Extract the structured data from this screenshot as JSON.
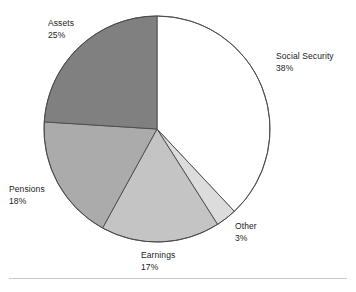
{
  "chart_data": {
    "type": "pie",
    "title": "",
    "subtitle": "",
    "xlabel": "",
    "ylabel": "",
    "legend_position": "none",
    "grid": false,
    "units": "percent",
    "start_angle_deg": 0,
    "direction": "clockwise",
    "categories": [
      "Social Security",
      "Other",
      "Earnings",
      "Pensions",
      "Assets"
    ],
    "values": [
      38,
      3,
      17,
      18,
      25
    ],
    "slices": [
      {
        "label": "Social Security",
        "value": 38,
        "value_text": "38%",
        "color": "#ffffff",
        "start_deg": 0,
        "end_deg": 136.8
      },
      {
        "label": "Other",
        "value": 3,
        "value_text": "3%",
        "color": "#dcdcdc",
        "start_deg": 136.8,
        "end_deg": 147.6
      },
      {
        "label": "Earnings",
        "value": 17,
        "value_text": "17%",
        "color": "#c4c4c4",
        "start_deg": 147.6,
        "end_deg": 208.8
      },
      {
        "label": "Pensions",
        "value": 18,
        "value_text": "18%",
        "color": "#ababab",
        "start_deg": 208.8,
        "end_deg": 273.6
      },
      {
        "label": "Assets",
        "value": 25,
        "value_text": "25%",
        "color": "#808080",
        "start_deg": 273.6,
        "end_deg": 360
      }
    ],
    "geometry": {
      "center_x": 157,
      "center_y": 129,
      "radius": 113
    },
    "style": {
      "outline_color": "#4a4a4a",
      "outline_width": 0.9,
      "background": "#ffffff",
      "label_color": "#1b1b1b",
      "rule_color": "#c9c9c9"
    }
  },
  "labels": {
    "social_security": {
      "name": "Social Security",
      "value": "38%"
    },
    "assets": {
      "name": "Assets",
      "value": "25%"
    },
    "pensions": {
      "name": "Pensions",
      "value": "18%"
    },
    "earnings": {
      "name": "Earnings",
      "value": "17%"
    },
    "other": {
      "name": "Other",
      "value": "3%"
    }
  }
}
